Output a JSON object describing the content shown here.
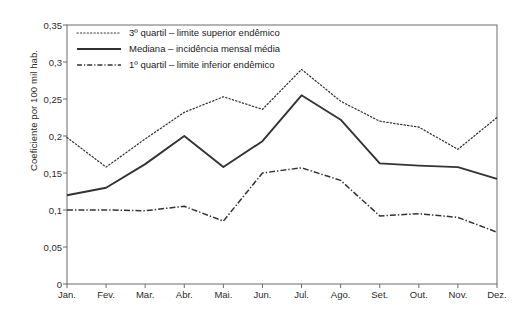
{
  "chart_data": {
    "type": "line",
    "title": "",
    "xlabel": "",
    "ylabel": "Coeficiente por 100 mil hab.",
    "categories": [
      "Jan.",
      "Fev.",
      "Mar.",
      "Abr.",
      "Mai.",
      "Jun.",
      "Jul.",
      "Ago.",
      "Set.",
      "Out.",
      "Nov.",
      "Dez."
    ],
    "ylim": [
      0,
      0.35
    ],
    "ytick_labels": [
      "0,35",
      "0,3",
      "0,25",
      "0,2",
      "0,15",
      "0,1",
      "0,05",
      "0"
    ],
    "ytick_values": [
      0.35,
      0.3,
      0.25,
      0.2,
      0.15,
      0.1,
      0.05,
      0
    ],
    "grid": false,
    "legend_position": "top-left",
    "series": [
      {
        "name": "3º quartil – limite superior endêmico",
        "style": "dotted",
        "color": "#333333",
        "values": [
          0.198,
          0.158,
          0.196,
          0.232,
          0.253,
          0.236,
          0.29,
          0.247,
          0.22,
          0.212,
          0.182,
          0.225
        ]
      },
      {
        "name": "Mediana – incidência mensal média",
        "style": "solid",
        "color": "#333333",
        "values": [
          0.12,
          0.13,
          0.162,
          0.2,
          0.158,
          0.193,
          0.255,
          0.222,
          0.163,
          0.16,
          0.158,
          0.142
        ]
      },
      {
        "name": "1º quartil – limite inferior endêmico",
        "style": "dashdot",
        "color": "#333333",
        "values": [
          0.1,
          0.1,
          0.099,
          0.105,
          0.085,
          0.15,
          0.157,
          0.14,
          0.092,
          0.095,
          0.09,
          0.07
        ]
      }
    ]
  },
  "legend": {
    "items": [
      {
        "label": "3º quartil – limite superior endêmico",
        "key": "dotted-line-key"
      },
      {
        "label": "Mediana – incidência mensal média",
        "key": "solid-line-key"
      },
      {
        "label": "1º quartil – limite inferior endêmico",
        "key": "dashdot-line-key"
      }
    ]
  },
  "axes": {
    "y_title": "Coeficiente por 100 mil hab."
  }
}
